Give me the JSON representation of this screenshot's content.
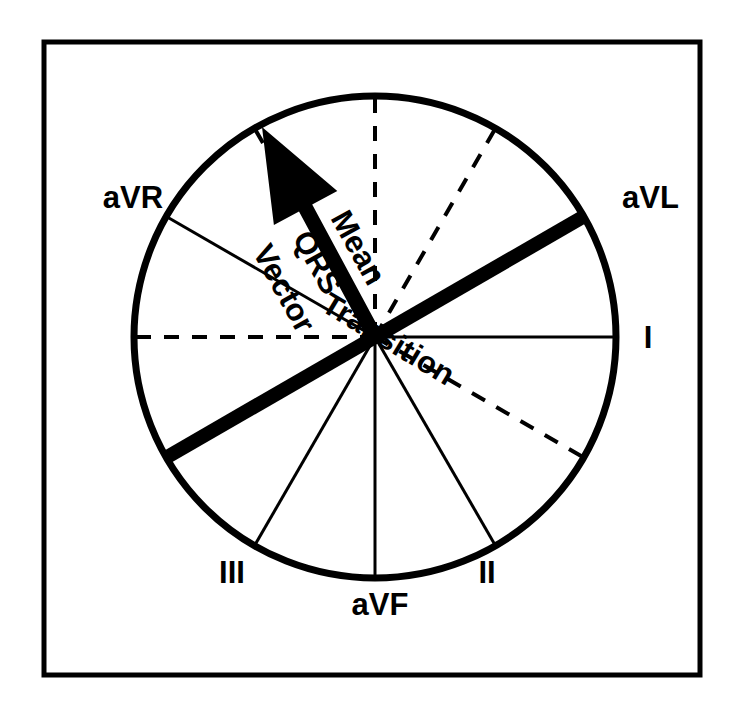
{
  "figure": {
    "kind": "hexaxial-reference-diagram",
    "background_color": "#ffffff",
    "ink_color": "#000000"
  },
  "frame": {
    "name": "outer-border",
    "x": 44,
    "y": 42,
    "width": 656,
    "height": 633,
    "stroke_width": 5,
    "color": "#000000"
  },
  "circle": {
    "center_x": 375,
    "center_y": 337,
    "radius": 241,
    "stroke_width": 7,
    "color": "#000000"
  },
  "axes": [
    {
      "name": "lead-I-positive",
      "label": "I",
      "angle_deg": 0,
      "style": "solid",
      "stroke_width": 3,
      "label_x": 648,
      "label_y": 348,
      "label_anchor": "middle"
    },
    {
      "name": "lead-aVL-negative-dashed",
      "label": "",
      "angle_deg": 30,
      "style": "dashed",
      "stroke_width": 4,
      "label_x": 0,
      "label_y": 0,
      "label_anchor": "middle"
    },
    {
      "name": "lead-II-positive",
      "label": "II",
      "angle_deg": 60,
      "style": "solid",
      "stroke_width": 3,
      "label_x": 487,
      "label_y": 583,
      "label_anchor": "middle"
    },
    {
      "name": "lead-aVF-positive",
      "label": "aVF",
      "angle_deg": 90,
      "style": "solid",
      "stroke_width": 3,
      "label_x": 380,
      "label_y": 615,
      "label_anchor": "middle"
    },
    {
      "name": "lead-III-positive",
      "label": "III",
      "angle_deg": 120,
      "style": "solid",
      "stroke_width": 3,
      "label_x": 232,
      "label_y": 583,
      "label_anchor": "middle"
    },
    {
      "name": "lead-aVL-negative-thick",
      "label": "",
      "angle_deg": 150,
      "style": "thick",
      "stroke_width": 14,
      "label_x": 0,
      "label_y": 0,
      "label_anchor": "middle"
    },
    {
      "name": "lead-I-negative-dashed",
      "label": "",
      "angle_deg": 180,
      "style": "dashed",
      "stroke_width": 4,
      "label_x": 0,
      "label_y": 0,
      "label_anchor": "middle"
    },
    {
      "name": "lead-aVR-positive",
      "label": "aVR",
      "angle_deg": 210,
      "style": "solid",
      "stroke_width": 3,
      "label_x": 133,
      "label_y": 208,
      "label_anchor": "middle"
    },
    {
      "name": "lead-III-negative-dashed",
      "label": "",
      "angle_deg": 240,
      "style": "dashed",
      "stroke_width": 4,
      "label_x": 0,
      "label_y": 0,
      "label_anchor": "middle"
    },
    {
      "name": "lead-aVF-negative-dashed",
      "label": "",
      "angle_deg": 270,
      "style": "dashed",
      "stroke_width": 4,
      "label_x": 0,
      "label_y": 0,
      "label_anchor": "middle"
    },
    {
      "name": "lead-II-negative-dashed",
      "label": "",
      "angle_deg": 300,
      "style": "dashed",
      "stroke_width": 4,
      "label_x": 0,
      "label_y": 0,
      "label_anchor": "middle"
    },
    {
      "name": "lead-aVL-positive-thick",
      "label": "aVL",
      "angle_deg": 330,
      "style": "thick",
      "stroke_width": 14,
      "label_x": 622,
      "label_y": 208,
      "label_anchor": "start"
    }
  ],
  "vector_arrow": {
    "name": "mean-qrs-vector-arrow",
    "angle_deg": 240,
    "tip_x": 262,
    "tip_y": 127,
    "tail_x": 375,
    "tail_y": 337,
    "shaft_width": 15,
    "head_length": 92,
    "head_half_width": 36,
    "color": "#000000",
    "label_lines": [
      "Mean",
      "QRS",
      "Vector"
    ],
    "label_rotation_deg": 61
  },
  "transition": {
    "name": "transition-axis",
    "label": "Transition",
    "angle_deg": 150,
    "label_rotation_deg": 31,
    "label_x": 383,
    "label_y": 348,
    "stroke_width": 14,
    "color": "#000000"
  },
  "labels": {
    "aVR": "aVR",
    "aVL": "aVL",
    "lead_I": "I",
    "lead_II": "II",
    "lead_III": "III",
    "aVF": "aVF",
    "transition": "Transition",
    "mean": "Mean",
    "qrs": "QRS",
    "vector": "Vector"
  },
  "typography": {
    "lead_label_size": 31,
    "vector_label_size": 31,
    "transition_label_size": 31
  }
}
